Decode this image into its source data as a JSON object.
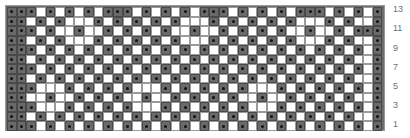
{
  "chart": {
    "title": "",
    "columns": 39,
    "rows_count": 13,
    "legend": {
      "D": "dark stitch with dot",
      "W": "white stitch"
    },
    "colors": {
      "dark": "#6a6a6a",
      "white": "#ffffff",
      "dot": "#111111",
      "label": "#707070"
    },
    "row_labels": [
      {
        "text": "13",
        "top": 4
      },
      {
        "text": "11",
        "top": 23
      },
      {
        "text": "9",
        "top": 43
      },
      {
        "text": "7",
        "top": 62
      },
      {
        "text": "5",
        "top": 81
      },
      {
        "text": "3",
        "top": 100
      },
      {
        "text": "1",
        "top": 119
      }
    ],
    "rows": [
      "DDDWDWDWDWDDDWDWDWDWDDDWDWDWDWDDDWDWDWD",
      "DDWDWDWWWDWDWDWDWDWWWDWDWDWDWDWWWDWDWWD",
      "DDDWDWWDWWDWDWDWDWWDWWDWDWDWDWWDWWDWDDD",
      "DDWDWDWWWDWDWDWDWDWWWDWDWDWDWDWWWDWDWWD",
      "DDDWDWDWDWDWDWDWDWDWDWDWDWDWDWDWDWDWDWD",
      "DDWDWDWDWDWDWDWDWDWDWDWDWDWDWDWDWDWDWWD",
      "DDDWDWDWDWDWDWDWDWDWDWDWDWDWDWDWDWDWDWD",
      "DDWDWDWDWDWDWDWDWDWDWDWDWDWDWDWDWDWDWWD",
      "DDDWWWDWDWDWDWWWDWDWDWDWDWWWDWDWDWDWDWD",
      "DDWWDWWDWDWDWWDWWDWDWDWDWWDWWDWDWDWDWWD",
      "DDDWWWDWDWDWDWWWDWDWDWDWDWWWDWDWDWDWDWD",
      "DDWDWDWDWDWDWDWDWDWDWDWDWDWDWDWDWDWDWWD",
      "DDDWDWDWDWDWDWDWDWDWDWDWDWDWDWDWDWDWDWD"
    ]
  }
}
